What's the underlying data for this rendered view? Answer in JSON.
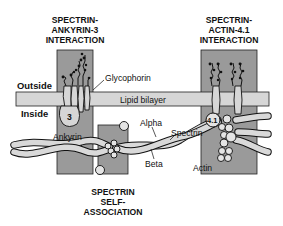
{
  "diagram": {
    "regions": {
      "ankyrin": {
        "title_lines": [
          "SPECTRIN-",
          "ANKYRIN-3",
          "INTERACTION"
        ]
      },
      "actin": {
        "title_lines": [
          "SPECTRIN-",
          "ACTIN-4.1",
          "INTERACTION"
        ]
      },
      "self": {
        "title_lines": [
          "SPECTRIN",
          "SELF-",
          "ASSOCIATION"
        ]
      }
    },
    "sides": {
      "outside": "Outside",
      "inside": "Inside"
    },
    "labels": {
      "glycophorin": "Glycophorin",
      "lipid_bilayer": "Lipid bilayer",
      "band3": "3",
      "ankyrin": "Ankyrin",
      "alpha": "Alpha",
      "spectrin": "Spectrin",
      "beta": "Beta",
      "protein41": "4.1",
      "actin": "Actin"
    },
    "colors": {
      "region_fill": "#9a9a9a",
      "bilayer_fill": "#d6d6d6",
      "strand_fill": "#d9d9d9",
      "outline": "#111111"
    }
  }
}
